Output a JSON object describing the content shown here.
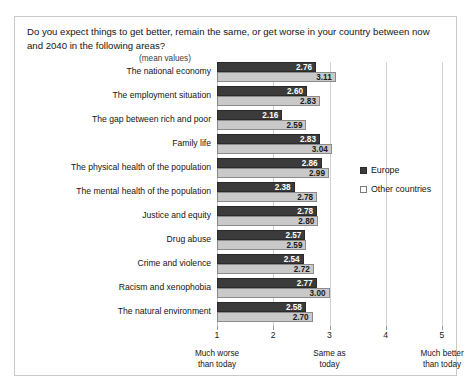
{
  "frame": {
    "question": "Do you expect things to get better, remain the same, or get worse in your country between now and 2040 in the following areas?",
    "subtitle": "(mean values)"
  },
  "legend": {
    "items": [
      {
        "label": "Europe",
        "color": "#3b3b3b"
      },
      {
        "label": "Other countries",
        "color": "#c9c9c9"
      }
    ]
  },
  "axis": {
    "ticks": [
      "1",
      "2",
      "3",
      "4",
      "5"
    ],
    "anchors": [
      {
        "value": 1,
        "line1": "Much worse",
        "line2": "than today"
      },
      {
        "value": 3,
        "line1": "Same as",
        "line2": "today"
      },
      {
        "value": 5,
        "line1": "Much better",
        "line2": "than today"
      }
    ]
  },
  "chart_data": {
    "type": "bar",
    "orientation": "horizontal",
    "title": "Do you expect things to get better, remain the same, or get worse in your country between now and 2040 in the following areas?",
    "subtitle": "(mean values)",
    "xlabel": "",
    "ylabel": "",
    "xlim": [
      1,
      5
    ],
    "xticks": [
      1,
      2,
      3,
      4,
      5
    ],
    "grid": true,
    "legend_position": "right",
    "scale_anchors": {
      "1": "Much worse than today",
      "3": "Same as today",
      "5": "Much better than today"
    },
    "categories": [
      "The national economy",
      "The employment situation",
      "The gap between rich and poor",
      "Family life",
      "The physical health of the population",
      "The mental health of the population",
      "Justice and equity",
      "Drug abuse",
      "Crime and violence",
      "Racism and xenophobia",
      "The natural environment"
    ],
    "series": [
      {
        "name": "Europe",
        "color": "#3b3b3b",
        "values": [
          2.76,
          2.6,
          2.16,
          2.83,
          2.86,
          2.38,
          2.78,
          2.57,
          2.54,
          2.77,
          2.58
        ],
        "labels": [
          "2.76",
          "2.60",
          "2.16",
          "2.83",
          "2.86",
          "2.38",
          "2.78",
          "2.57",
          "2.54",
          "2.77",
          "2.58"
        ]
      },
      {
        "name": "Other countries",
        "color": "#c9c9c9",
        "values": [
          3.11,
          2.83,
          2.59,
          3.04,
          2.99,
          2.78,
          2.8,
          2.59,
          2.72,
          3.0,
          2.7
        ],
        "labels": [
          "3.11",
          "2.83",
          "2.59",
          "3.04",
          "2.99",
          "2.78",
          "2.80",
          "2.59",
          "2.72",
          "3.00",
          "2.70"
        ]
      }
    ]
  }
}
